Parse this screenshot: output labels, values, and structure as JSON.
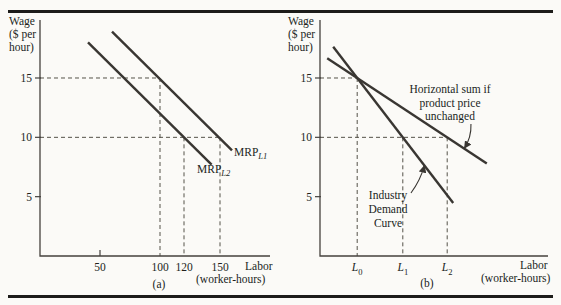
{
  "figure": {
    "background": "#fbfaf7",
    "rule_color": "#1d1c1a",
    "line_color": "#393632",
    "guide_color": "#555249",
    "axis_color": "#45423e"
  },
  "chart_data": [
    {
      "id": "a",
      "type": "line",
      "panel_label": "(a)",
      "ylabel_lines": [
        "Wage",
        "($ per",
        "hour)"
      ],
      "xlabel_lines": [
        "Labor",
        "(worker-hours)"
      ],
      "x_range": [
        0,
        192
      ],
      "y_range": [
        0,
        19.9
      ],
      "grid": false,
      "y_ticks": [
        {
          "y": 15,
          "label": "15"
        },
        {
          "y": 10,
          "label": "10"
        },
        {
          "y": 5,
          "label": "5"
        }
      ],
      "x_ticks": [
        {
          "x": 50,
          "label": "50",
          "tick": true
        },
        {
          "x": 100,
          "label": "100"
        },
        {
          "x": 120,
          "label": "120"
        },
        {
          "x": 150,
          "label": "150"
        }
      ],
      "series": [
        {
          "name": "MRP-L1",
          "label": "MRP",
          "sub": "L1",
          "points": [
            [
              60,
              18.9
            ],
            [
              160,
              8.9
            ]
          ]
        },
        {
          "name": "MRP-L2",
          "label": "MRP",
          "sub": "L2",
          "points": [
            [
              40,
              18.0
            ],
            [
              143,
              7.7
            ]
          ]
        }
      ],
      "key_points": [
        {
          "x": 100,
          "y": 15,
          "on": "MRP-L1"
        },
        {
          "x": 150,
          "y": 10,
          "on": "MRP-L1"
        },
        {
          "x": 120,
          "y": 10,
          "on": "MRP-L2"
        }
      ],
      "guides": [
        {
          "x1": 0,
          "y1": 15,
          "x2": 100,
          "y2": 15
        },
        {
          "x1": 100,
          "y1": 15,
          "x2": 100,
          "y2": 0
        },
        {
          "x1": 0,
          "y1": 10,
          "x2": 150,
          "y2": 10
        },
        {
          "x1": 120,
          "y1": 10,
          "x2": 120,
          "y2": 0
        },
        {
          "x1": 150,
          "y1": 10,
          "x2": 150,
          "y2": 0
        }
      ],
      "annotations": []
    },
    {
      "id": "b",
      "type": "line",
      "panel_label": "(b)",
      "ylabel_lines": [
        "Wage",
        "($ per",
        "hour)"
      ],
      "xlabel_lines": [
        "Labor",
        "(worker-hours)"
      ],
      "x_range": [
        0,
        190
      ],
      "y_range": [
        0,
        19.9
      ],
      "grid": false,
      "y_ticks": [
        {
          "y": 15,
          "label": "15"
        },
        {
          "y": 10,
          "label": "10"
        },
        {
          "y": 5,
          "label": "5"
        }
      ],
      "x_ticks": [
        {
          "x": 31,
          "label": "L",
          "sub": "0"
        },
        {
          "x": 69,
          "label": "L",
          "sub": "1"
        },
        {
          "x": 106,
          "label": "L",
          "sub": "2"
        }
      ],
      "series": [
        {
          "name": "industry-demand-curve",
          "points": [
            [
              11,
              17.63
            ],
            [
              111,
              4.47
            ]
          ]
        },
        {
          "name": "horizontal-sum",
          "points": [
            [
              6,
              16.67
            ],
            [
              139,
              7.8
            ]
          ]
        }
      ],
      "key_points": [
        {
          "x": 31,
          "y": 15,
          "on": "both"
        },
        {
          "x": 69,
          "y": 10,
          "on": "industry-demand-curve"
        },
        {
          "x": 106,
          "y": 10,
          "on": "horizontal-sum"
        }
      ],
      "guides": [
        {
          "x1": 0,
          "y1": 15,
          "x2": 31,
          "y2": 15
        },
        {
          "x1": 31,
          "y1": 15,
          "x2": 31,
          "y2": 0
        },
        {
          "x1": 0,
          "y1": 10,
          "x2": 106,
          "y2": 10
        },
        {
          "x1": 69,
          "y1": 10,
          "x2": 69,
          "y2": 0
        },
        {
          "x1": 106,
          "y1": 10,
          "x2": 106,
          "y2": 0
        }
      ],
      "annotations": [
        {
          "name": "horizontal-sum-label",
          "lines": [
            "Horizontal sum if",
            "product price",
            "unchanged"
          ],
          "arrow": {
            "from": [
              125.8,
              11.12
            ],
            "to": [
              120.3,
              9.07
            ],
            "bend": -4
          }
        },
        {
          "name": "industry-demand-label",
          "lines": [
            "Industry",
            "Demand",
            "Curve"
          ],
          "arrow": {
            "from": [
              75.8,
              5.31
            ],
            "to": [
              87,
              7.63
            ],
            "bend": 3
          }
        }
      ]
    }
  ]
}
